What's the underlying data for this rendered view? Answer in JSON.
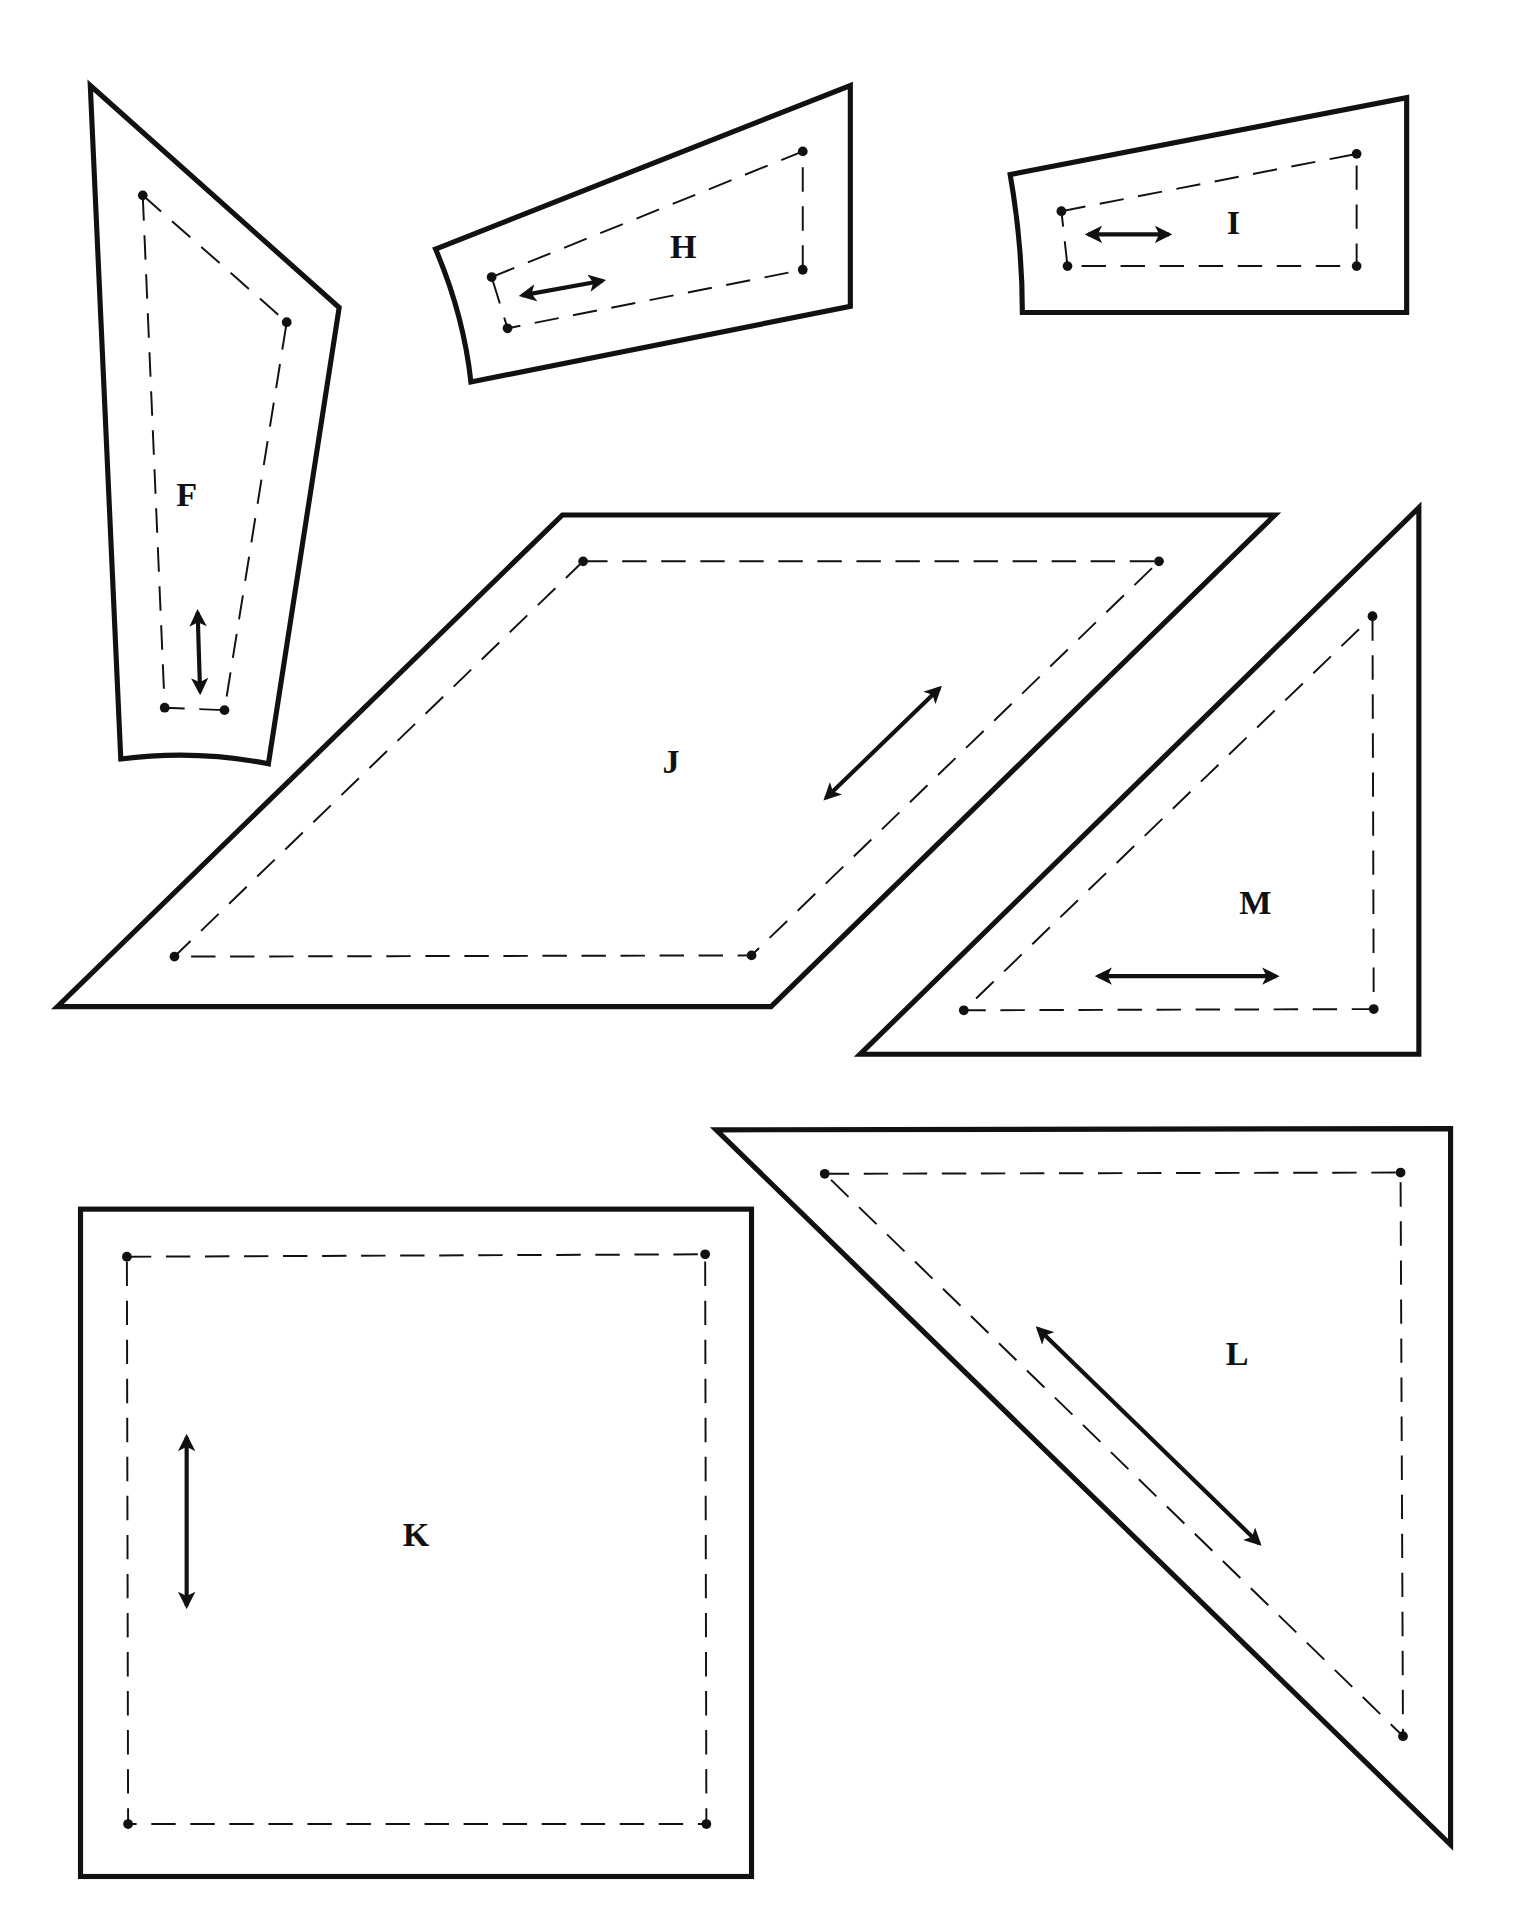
{
  "colors": {
    "line": "#111111",
    "background": "#ffffff"
  },
  "pieces": [
    {
      "id": "F",
      "label": "F",
      "shape": "quadrilateral (tapered)",
      "grainline": "vertical"
    },
    {
      "id": "H",
      "label": "H",
      "shape": "quadrilateral (tapered)",
      "grainline": "horizontal"
    },
    {
      "id": "I",
      "label": "I",
      "shape": "quadrilateral (tapered)",
      "grainline": "horizontal"
    },
    {
      "id": "J",
      "label": "J",
      "shape": "parallelogram",
      "grainline": "diagonal"
    },
    {
      "id": "M",
      "label": "M",
      "shape": "right triangle",
      "grainline": "horizontal"
    },
    {
      "id": "L",
      "label": "L",
      "shape": "right triangle",
      "grainline": "diagonal"
    },
    {
      "id": "K",
      "label": "K",
      "shape": "square",
      "grainline": "vertical"
    }
  ],
  "legend": {
    "outline": "cutting line (solid)",
    "seam": "sewing line (dashed)",
    "dots": "seam corner points",
    "arrow": "grainline"
  }
}
